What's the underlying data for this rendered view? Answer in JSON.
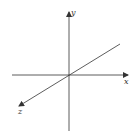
{
  "diagram": {
    "type": "3d-coordinate-axes",
    "axes": [
      {
        "name": "x",
        "label": "x",
        "direction": "right"
      },
      {
        "name": "y",
        "label": "y",
        "direction": "up"
      },
      {
        "name": "z",
        "label": "z",
        "direction": "lower-left"
      }
    ],
    "colors": {
      "axis": "#333333",
      "background": "#ffffff"
    }
  }
}
